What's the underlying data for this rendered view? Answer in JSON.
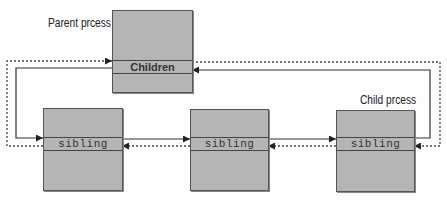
{
  "diagram": {
    "labels": {
      "parent": "Parent prcess",
      "child": "Child prcess"
    },
    "nodes": [
      {
        "id": "parent",
        "band_label": "Children"
      },
      {
        "id": "sibling1",
        "band_label": "sibling"
      },
      {
        "id": "sibling2",
        "band_label": "sibling"
      },
      {
        "id": "sibling3",
        "band_label": "sibling"
      }
    ],
    "edges": [
      {
        "from": "parent.children",
        "to": "sibling1",
        "style": "solid",
        "meaning": "children list first"
      },
      {
        "from": "sibling1",
        "to": "parent.children",
        "style": "dashed",
        "meaning": "list back link"
      },
      {
        "from": "sibling1",
        "to": "sibling2",
        "style": "solid"
      },
      {
        "from": "sibling2",
        "to": "sibling1",
        "style": "dashed"
      },
      {
        "from": "sibling2",
        "to": "sibling3",
        "style": "solid"
      },
      {
        "from": "sibling3",
        "to": "sibling2",
        "style": "dashed"
      },
      {
        "from": "sibling3",
        "to": "parent.children",
        "style": "solid"
      },
      {
        "from": "parent.children",
        "to": "sibling3",
        "style": "dashed"
      }
    ],
    "colors": {
      "box_fill": "#b5b5b5",
      "line": "#333333"
    }
  }
}
